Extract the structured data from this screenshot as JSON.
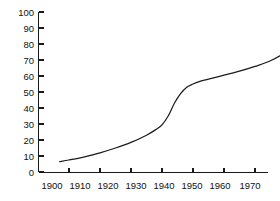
{
  "chart_data": {
    "type": "line",
    "title": "",
    "subtitle": "",
    "xlabel": "",
    "ylabel": "",
    "xlim": [
      1897,
      1972
    ],
    "ylim": [
      0,
      100
    ],
    "grid": false,
    "legend": null,
    "legend_position": "none",
    "line_color": "#1c1c1c",
    "axis_color": "#1a1a1a",
    "background_color": "#ffffff",
    "x_ticks": [
      1900,
      1910,
      1920,
      1930,
      1940,
      1950,
      1960,
      1970
    ],
    "x_tick_labels": [
      "1900",
      "1910",
      "1920",
      "1930",
      "1940",
      "1950",
      "1960",
      "1970"
    ],
    "y_ticks": [
      0,
      10,
      20,
      30,
      40,
      50,
      60,
      70,
      80,
      90,
      100
    ],
    "y_tick_labels": [
      "0",
      "10",
      "20",
      "30",
      "40",
      "50",
      "60",
      "70",
      "80",
      "90",
      "100"
    ],
    "series": [
      {
        "name": "",
        "x": [
          1897,
          1900,
          1905,
          1910,
          1915,
          1920,
          1925,
          1928,
          1930,
          1932,
          1934,
          1936,
          1938,
          1940,
          1942,
          1945,
          1950,
          1955,
          1960,
          1965,
          1970,
          1971
        ],
        "values": [
          6.5,
          7.5,
          9.5,
          12,
          15,
          18.5,
          23,
          26.5,
          29.5,
          35,
          43,
          49,
          53,
          55,
          56.5,
          58,
          60.5,
          63,
          66,
          69.5,
          75,
          77
        ]
      }
    ]
  }
}
